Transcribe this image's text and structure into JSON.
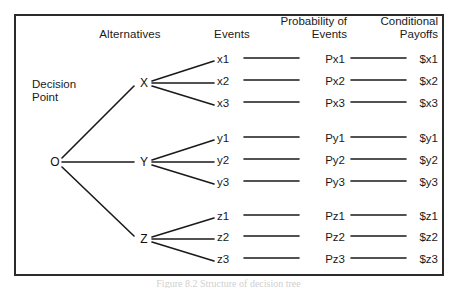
{
  "diagram": {
    "type": "decision-tree",
    "root": {
      "node_label": "O",
      "caption_line1": "Decision",
      "caption_line2": "Point"
    },
    "headers": {
      "alternatives": "Alternatives",
      "events": "Events",
      "probability_line1": "Probability of",
      "probability_line2": "Events",
      "payoffs_line1": "Conditional",
      "payoffs_line2": "Payoffs"
    },
    "branches": [
      {
        "node_label": "X",
        "rows": [
          {
            "event": "x1",
            "probability": "Px1",
            "payoff": "$x1"
          },
          {
            "event": "x2",
            "probability": "Px2",
            "payoff": "$x2"
          },
          {
            "event": "x3",
            "probability": "Px3",
            "payoff": "$x3"
          }
        ]
      },
      {
        "node_label": "Y",
        "rows": [
          {
            "event": "y1",
            "probability": "Py1",
            "payoff": "$y1"
          },
          {
            "event": "y2",
            "probability": "Py2",
            "payoff": "$y2"
          },
          {
            "event": "y3",
            "probability": "Py3",
            "payoff": "$y3"
          }
        ]
      },
      {
        "node_label": "Z",
        "rows": [
          {
            "event": "z1",
            "probability": "Pz1",
            "payoff": "$z1"
          },
          {
            "event": "z2",
            "probability": "Pz2",
            "payoff": "$z2"
          },
          {
            "event": "z3",
            "probability": "Pz3",
            "payoff": "$z3"
          }
        ]
      }
    ],
    "colors": {
      "line": "#1a1a1a",
      "frame": "#2b2b2b",
      "text": "#1a1a1a",
      "background": "#ffffff"
    },
    "footer_caption": "Figure 8.2 Structure of decision tree"
  }
}
